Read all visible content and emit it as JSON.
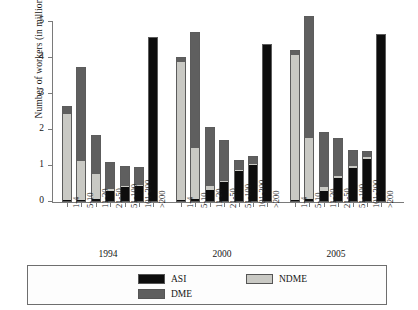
{
  "chart_data": {
    "type": "bar",
    "stacked": true,
    "title": "",
    "xlabel": "",
    "ylabel": "Number of workers (in millions)",
    "ylim": [
      0,
      5
    ],
    "yticks": [
      0,
      1,
      2,
      3,
      4,
      5
    ],
    "ytick_labels": [
      "0",
      "1",
      "2",
      "3",
      "4",
      "5"
    ],
    "grid": false,
    "legend_position": "bottom",
    "categories": [
      "1-4",
      "5-10",
      "11-20",
      "21-50",
      "51-100",
      "101-200",
      ">200"
    ],
    "groups": [
      "1994",
      "2000",
      "2005"
    ],
    "legend_entries": [
      "ASI",
      "NDME",
      "DME"
    ],
    "colors": {
      "ASI": "#0d0d0d",
      "NDME": "#c9c9c4",
      "DME": "#5f5f5f",
      "axis": "#7a7a7a",
      "text": "#161616",
      "background": "#ffffff"
    },
    "series": [
      {
        "name": "ASI",
        "group_values": {
          "1994": [
            0.03,
            0.04,
            0.05,
            0.28,
            0.38,
            0.42,
            4.52
          ],
          "2000": [
            0.03,
            0.05,
            0.3,
            0.52,
            0.82,
            1.0,
            4.32
          ],
          "2005": [
            0.03,
            0.06,
            0.28,
            0.65,
            0.92,
            1.18,
            4.62
          ]
        }
      },
      {
        "name": "NDME",
        "group_values": {
          "1994": [
            2.38,
            1.06,
            0.7,
            0.05,
            0.04,
            0.03,
            0.0
          ],
          "2000": [
            3.82,
            1.42,
            0.12,
            0.04,
            0.04,
            0.03,
            0.0
          ],
          "2005": [
            4.02,
            1.68,
            0.1,
            0.04,
            0.04,
            0.03,
            0.0
          ]
        }
      },
      {
        "name": "DME",
        "group_values": {
          "1994": [
            0.2,
            2.6,
            1.05,
            0.72,
            0.52,
            0.48,
            0.0
          ],
          "2000": [
            0.12,
            3.2,
            1.62,
            1.1,
            0.25,
            0.18,
            0.0
          ],
          "2005": [
            0.13,
            3.38,
            1.52,
            1.02,
            0.42,
            0.14,
            0.0
          ]
        }
      }
    ],
    "bar_totals": {
      "1994": [
        2.61,
        3.7,
        1.8,
        1.05,
        0.94,
        0.93,
        4.52
      ],
      "2000": [
        3.97,
        4.67,
        2.04,
        1.66,
        1.11,
        1.21,
        4.32
      ],
      "2005": [
        4.18,
        5.12,
        1.9,
        1.71,
        1.38,
        1.35,
        4.62
      ]
    }
  },
  "legend": {
    "items": [
      {
        "label": "ASI",
        "key": "asi"
      },
      {
        "label": "NDME",
        "key": "ndme"
      },
      {
        "label": "DME",
        "key": "dme"
      }
    ]
  }
}
